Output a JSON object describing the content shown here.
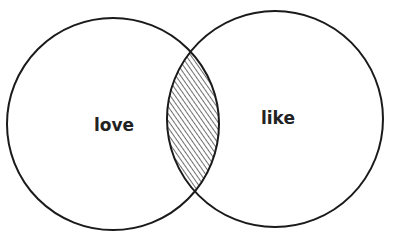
{
  "diagram": {
    "type": "venn",
    "sets": [
      {
        "id": "love",
        "label": "love"
      },
      {
        "id": "like",
        "label": "like"
      }
    ],
    "intersection": {
      "sets": [
        "love",
        "like"
      ],
      "fill": "hatched"
    },
    "stroke_color": "#1a1a1a",
    "background": "#ffffff"
  }
}
